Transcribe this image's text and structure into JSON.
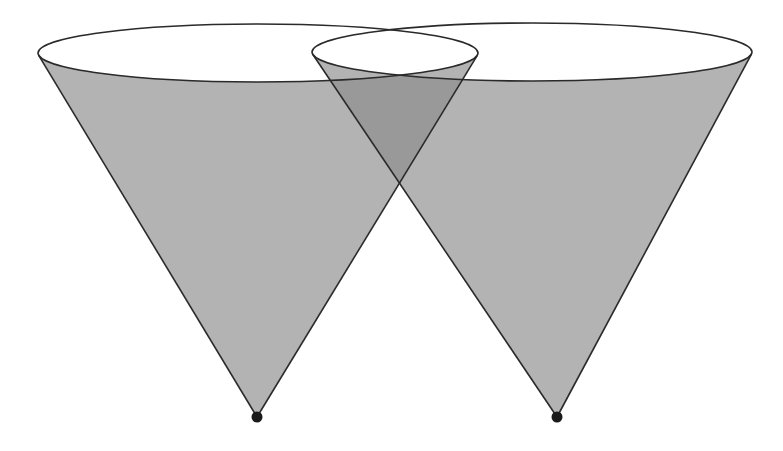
{
  "diagram": {
    "colors": {
      "background": "#ffffff",
      "cone_fill": "#b3b3b3",
      "overlap_fill": "#999999",
      "stroke": "#2a2a2a",
      "apex": "#1a1a1a",
      "top_ellipse_fill": "#ffffff"
    },
    "cones": [
      {
        "name": "left-cone",
        "apex": {
          "x": 257,
          "y": 417
        },
        "top_ellipse": {
          "cx": 258,
          "cy": 53,
          "rx": 220,
          "ry": 29
        }
      },
      {
        "name": "right-cone",
        "apex": {
          "x": 557,
          "y": 417
        },
        "top_ellipse": {
          "cx": 532,
          "cy": 52,
          "rx": 220,
          "ry": 29
        }
      }
    ]
  }
}
